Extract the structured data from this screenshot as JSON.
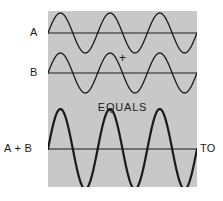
{
  "figure": {
    "panel_color": "#c8c8c8",
    "background_color": "#ffffff",
    "stroke_color": "#1a1a1a"
  },
  "labels": {
    "wave_a": "A",
    "wave_b": "B",
    "wave_sum": "A + B",
    "operator_plus": "+",
    "operator_equals": "EQUALS",
    "edge_text": "TO"
  },
  "chart_data": {
    "type": "line",
    "xlabel": "",
    "ylabel": "",
    "grid": false,
    "legend_position": "left",
    "x": [
      0,
      1
    ],
    "xlim": [
      0,
      1
    ],
    "ylim": [
      -1,
      1
    ],
    "cycles": 3,
    "series": [
      {
        "name": "A",
        "label": "A",
        "amplitude": 1,
        "cycles": 3,
        "phase_deg": 0,
        "baseline_y": 33,
        "stroke_width": 1.3,
        "values_description": "sin(2*pi*3*x), amplitude 1"
      },
      {
        "name": "B",
        "label": "B",
        "amplitude": 1,
        "cycles": 3,
        "phase_deg": 0,
        "baseline_y": 73,
        "stroke_width": 1.3,
        "values_description": "sin(2*pi*3*x), amplitude 1"
      },
      {
        "name": "A + B",
        "label": "A + B",
        "amplitude": 2,
        "cycles": 3,
        "phase_deg": 0,
        "baseline_y": 149,
        "stroke_width": 2.2,
        "values_description": "2*sin(2*pi*3*x), amplitude 2"
      }
    ],
    "annotations": [
      {
        "text": "+",
        "position": "between A and B"
      },
      {
        "text": "EQUALS",
        "position": "between B and A + B"
      }
    ]
  }
}
